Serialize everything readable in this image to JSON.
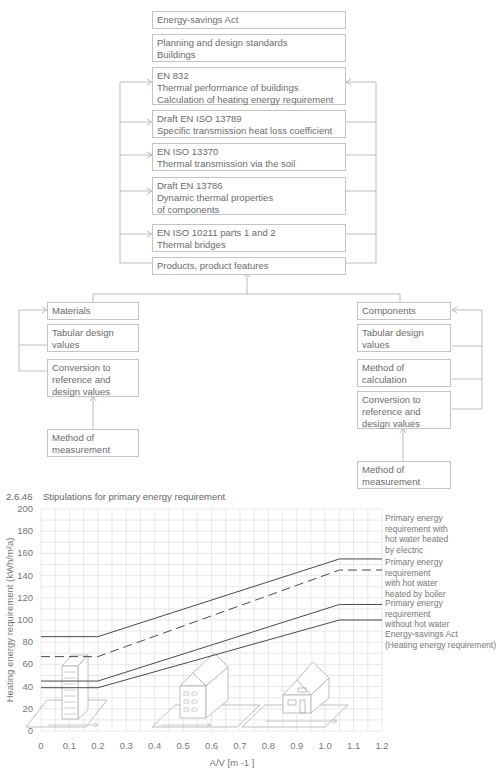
{
  "flowchart": {
    "top_boxes": [
      {
        "id": "energy-savings-act",
        "text": "Energy-savings Act"
      },
      {
        "id": "planning-standards",
        "text": "Planning and design standards\nBuildings"
      },
      {
        "id": "en-832",
        "text": "EN 832\nThermal performance of buildings\nCalculation of heating energy requirement"
      },
      {
        "id": "en-iso-13789",
        "text": "Draft EN ISO 13789\nSpecific transmission heat loss coefficient"
      },
      {
        "id": "en-iso-13370",
        "text": "EN ISO 13370\nThermal transmission via the soil"
      },
      {
        "id": "en-13786",
        "text": "Draft EN 13786\nDynamic thermal properties\nof components"
      },
      {
        "id": "en-iso-10211",
        "text": "EN ISO 10211 parts 1 and 2\nThermal bridges"
      },
      {
        "id": "products",
        "text": "Products, product features"
      }
    ],
    "materials": [
      {
        "id": "materials",
        "text": "Materials"
      },
      {
        "id": "materials-tabular",
        "text": "Tabular design\nvalues"
      },
      {
        "id": "materials-conversion",
        "text": "Conversion to\nreference and\ndesign values"
      },
      {
        "id": "materials-measurement",
        "text": "Method of\nmeasurement"
      }
    ],
    "components": [
      {
        "id": "components",
        "text": "Components"
      },
      {
        "id": "components-tabular",
        "text": "Tabular design\nvalues"
      },
      {
        "id": "components-calculation",
        "text": "Method of\ncalculation"
      },
      {
        "id": "components-conversion",
        "text": "Conversion to\nreference and\ndesign values"
      },
      {
        "id": "components-measurement",
        "text": "Method of\nmeasurement"
      }
    ]
  },
  "figure": {
    "number": "2.6.46",
    "caption": "Stipulations for primary energy requirement"
  },
  "chart_data": {
    "type": "line",
    "title": "Stipulations for primary energy requirement",
    "xlabel": "A/V  [m -1 ]",
    "ylabel": "Heating energy requirement (kWh/m²a)",
    "xlim": [
      0,
      1.2
    ],
    "ylim": [
      0,
      200
    ],
    "grid": true,
    "x_ticks": [
      "0",
      "0.1",
      "0.2",
      "0.3",
      "0.4",
      "0.5",
      "0.6",
      "0.7",
      "0.8",
      "0.9",
      "1.0",
      "1.1",
      "1.2"
    ],
    "y_ticks": [
      "0",
      "20",
      "40",
      "60",
      "80",
      "100",
      "120",
      "140",
      "160",
      "180",
      "200"
    ],
    "legend_position": "right",
    "series": [
      {
        "name": "Primary energy requirement with hot water heated by electric",
        "style": "solid",
        "x": [
          0,
          0.2,
          1.05,
          1.2
        ],
        "y": [
          85,
          85,
          155,
          155
        ]
      },
      {
        "name": "Primary energy requirement with hot water heated by boiler",
        "style": "dashed",
        "x": [
          0,
          0.2,
          1.05,
          1.2
        ],
        "y": [
          67,
          67,
          145,
          145
        ]
      },
      {
        "name": "Primary energy requirement without hot water",
        "style": "solid",
        "x": [
          0,
          0.2,
          1.05,
          1.2
        ],
        "y": [
          45,
          45,
          114,
          114
        ]
      },
      {
        "name": "Energy-savings Act (Heating energy requirement)",
        "style": "solid",
        "x": [
          0,
          0.2,
          1.05,
          1.2
        ],
        "y": [
          39,
          39,
          100,
          100
        ]
      }
    ],
    "legend_labels": [
      "Primary energy\nrequirement with\nhot water heated\nby electric",
      "Primary energy\nrequirement\nwith hot water\nheated by boiler",
      "Primary energy\nrequirement\nwithout hot water",
      "Energy-savings Act\n(Heating energy requirement)"
    ]
  }
}
